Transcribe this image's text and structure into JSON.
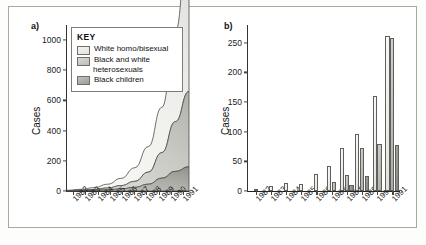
{
  "figure": {
    "panel_a_letter": "a)",
    "panel_b_letter": "b)"
  },
  "legend": {
    "title": "KEY",
    "items": [
      {
        "label": "White homo/bisexual",
        "continuation": "",
        "color": "#ededea"
      },
      {
        "label": "Black and white",
        "continuation": "heterosexuals",
        "color": "#bdbdb8"
      },
      {
        "label": "Black children",
        "continuation": "",
        "color": "#939390"
      }
    ]
  },
  "chart_data": [
    {
      "type": "area",
      "panel": "a)",
      "title": "",
      "xlabel": "",
      "ylabel": "Cases",
      "stacked": true,
      "grid": false,
      "legend_position": "top-left-inside",
      "ylim": [
        0,
        1100
      ],
      "yticks": [
        0,
        200,
        400,
        600,
        800,
        1000
      ],
      "categories": [
        "1982",
        "1983",
        "1984",
        "1985",
        "1986",
        "1987",
        "1988",
        "1989",
        "1990",
        "1991"
      ],
      "series": [
        {
          "name": "Black children",
          "values": [
            1,
            2,
            4,
            8,
            14,
            24,
            45,
            85,
            130,
            160
          ]
        },
        {
          "name": "Black and white heterosexuals",
          "values": [
            1,
            3,
            6,
            12,
            22,
            40,
            80,
            170,
            330,
            500
          ]
        },
        {
          "name": "White homo/bisexual",
          "values": [
            3,
            6,
            12,
            25,
            48,
            90,
            170,
            300,
            600,
            1100
          ]
        }
      ]
    },
    {
      "type": "bar",
      "panel": "b)",
      "title": "",
      "xlabel": "",
      "ylabel": "Cases",
      "grouped": true,
      "grid": false,
      "legend_position": "top-left-inside",
      "ylim": [
        0,
        280
      ],
      "yticks": [
        0,
        50,
        100,
        150,
        200,
        250
      ],
      "categories": [
        "1982",
        "1983",
        "1984",
        "1985",
        "1986",
        "1987",
        "1988",
        "1989",
        "1990",
        "1991"
      ],
      "series": [
        {
          "name": "White homo/bisexual",
          "values": [
            2,
            8,
            13,
            12,
            28,
            42,
            73,
            96,
            160,
            262
          ]
        },
        {
          "name": "Black and white heterosexuals",
          "values": [
            0,
            0,
            0,
            0,
            0,
            16,
            27,
            73,
            79,
            258
          ]
        },
        {
          "name": "Black children",
          "values": [
            0,
            0,
            0,
            0,
            0,
            0,
            10,
            25,
            0,
            77
          ]
        }
      ]
    }
  ]
}
